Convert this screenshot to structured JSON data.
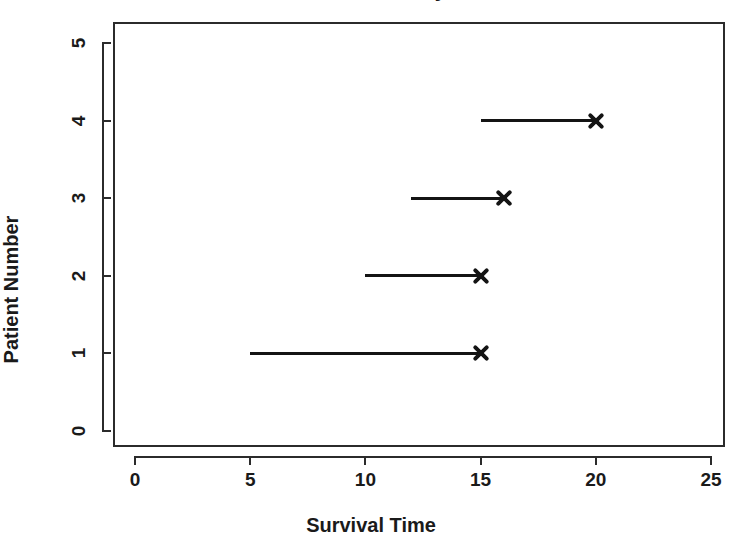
{
  "chart_data": {
    "type": "line",
    "title": "Survival Study",
    "xlabel": "Survival Time",
    "ylabel": "Patient Number",
    "xlim": [
      0,
      25
    ],
    "ylim": [
      0,
      5
    ],
    "xticks": [
      "0",
      "5",
      "10",
      "15",
      "20",
      "25"
    ],
    "xtick_values": [
      0,
      5,
      10,
      15,
      20,
      25
    ],
    "yticks": [
      "0",
      "1",
      "2",
      "3",
      "4",
      "5"
    ],
    "ytick_values": [
      0,
      1,
      2,
      3,
      4,
      5
    ],
    "grid": false,
    "legend": "none",
    "marker_symbol": "x",
    "series": [
      {
        "name": "Patient 1",
        "patient": 1,
        "start": 5,
        "end": 15,
        "event": "death",
        "marker": "x"
      },
      {
        "name": "Patient 2",
        "patient": 2,
        "start": 10,
        "end": 15,
        "event": "death",
        "marker": "x"
      },
      {
        "name": "Patient 3",
        "patient": 3,
        "start": 12,
        "end": 16,
        "event": "death",
        "marker": "x"
      },
      {
        "name": "Patient 4",
        "patient": 4,
        "start": 15,
        "end": 20,
        "event": "death",
        "marker": "x"
      }
    ],
    "colors": {
      "line": "#141414",
      "marker": "#141414",
      "axis": "#2b2b2b",
      "background": "#ffffff",
      "text": "#1a1a1a"
    }
  }
}
